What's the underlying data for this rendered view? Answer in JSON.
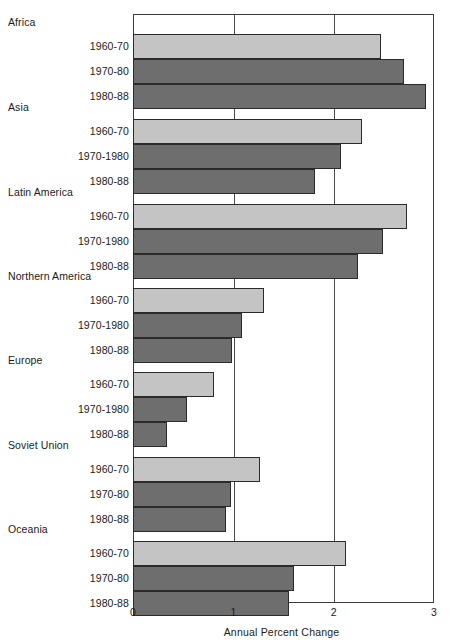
{
  "chart_data": {
    "type": "bar",
    "orientation": "horizontal",
    "title": "",
    "xlabel": "Annual Percent Change",
    "ylabel": "",
    "xlim": [
      0,
      3
    ],
    "xticks": [
      "0",
      "1",
      "2",
      "3"
    ],
    "xtick_values": [
      0,
      1,
      2,
      3
    ],
    "grid": true,
    "legend": "none",
    "series_colors": {
      "light": "#c4c4c4",
      "dark": "#6e6e6e",
      "border": "#2b2b2b",
      "frame": "#3a3a3a"
    },
    "groups": [
      {
        "region": "Africa",
        "bars": [
          {
            "period": "1960-70",
            "value": 2.47,
            "shade": "light"
          },
          {
            "period": "1970-80",
            "value": 2.7,
            "shade": "dark"
          },
          {
            "period": "1980-88",
            "value": 2.92,
            "shade": "dark"
          }
        ]
      },
      {
        "region": "Asia",
        "bars": [
          {
            "period": "1960-70",
            "value": 2.28,
            "shade": "light"
          },
          {
            "period": "1970-1980",
            "value": 2.07,
            "shade": "dark"
          },
          {
            "period": "1980-88",
            "value": 1.81,
            "shade": "dark"
          }
        ]
      },
      {
        "region": "Latin America",
        "bars": [
          {
            "period": "1960-70",
            "value": 2.73,
            "shade": "light"
          },
          {
            "period": "1970-1980",
            "value": 2.49,
            "shade": "dark"
          },
          {
            "period": "1980-88",
            "value": 2.24,
            "shade": "dark"
          }
        ]
      },
      {
        "region": "Northern America",
        "bars": [
          {
            "period": "1960-70",
            "value": 1.31,
            "shade": "light"
          },
          {
            "period": "1970-1980",
            "value": 1.09,
            "shade": "dark"
          },
          {
            "period": "1980-88",
            "value": 0.99,
            "shade": "dark"
          }
        ]
      },
      {
        "region": "Europe",
        "bars": [
          {
            "period": "1960-70",
            "value": 0.81,
            "shade": "light"
          },
          {
            "period": "1970-1980",
            "value": 0.54,
            "shade": "dark"
          },
          {
            "period": "1980-88",
            "value": 0.34,
            "shade": "dark"
          }
        ]
      },
      {
        "region": "Soviet Union",
        "bars": [
          {
            "period": "1960-70",
            "value": 1.27,
            "shade": "light"
          },
          {
            "period": "1970-80",
            "value": 0.98,
            "shade": "dark"
          },
          {
            "period": "1980-88",
            "value": 0.93,
            "shade": "dark"
          }
        ]
      },
      {
        "region": "Oceania",
        "bars": [
          {
            "period": "1960-70",
            "value": 2.12,
            "shade": "light"
          },
          {
            "period": "1970-80",
            "value": 1.6,
            "shade": "dark"
          },
          {
            "period": "1980-88",
            "value": 1.55,
            "shade": "dark"
          }
        ]
      }
    ]
  }
}
